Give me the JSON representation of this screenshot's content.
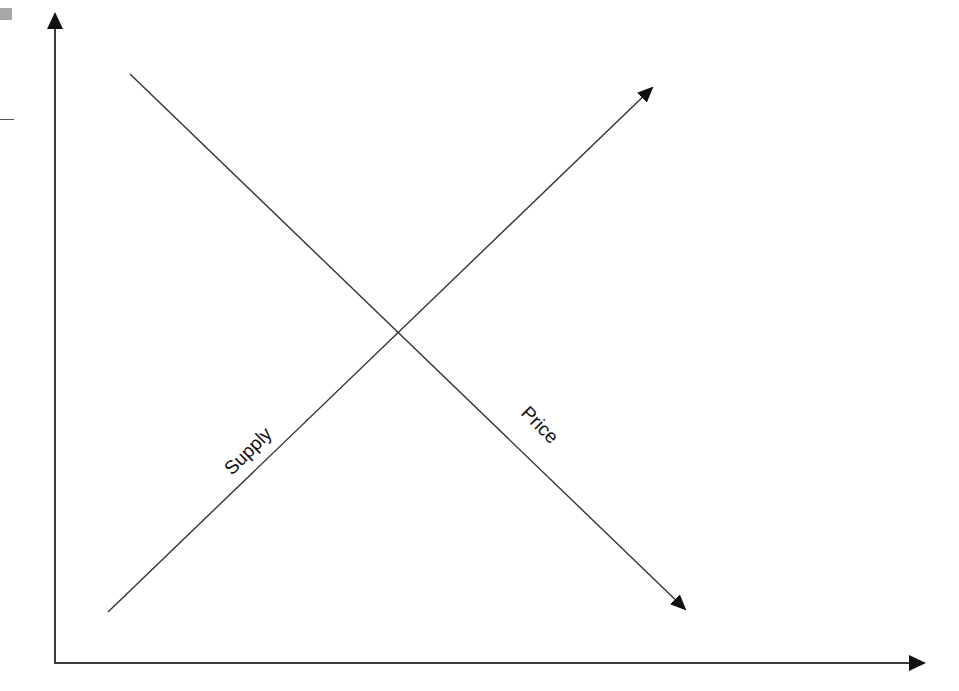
{
  "diagram": {
    "type": "supply-demand-style crossing lines",
    "labels": {
      "supply": "Supply",
      "price": "Price"
    },
    "colors": {
      "lines": "#333333",
      "axes": "#3a3a3a",
      "background": "#ffffff"
    },
    "axes": {
      "y_axis": {
        "x": 55,
        "y_top": 12,
        "y_bottom": 663,
        "arrow": "up"
      },
      "x_axis": {
        "y": 663,
        "x_left": 55,
        "x_right": 926,
        "arrow": "right"
      }
    },
    "lines": [
      {
        "name": "Supply",
        "from": [
          108,
          612
        ],
        "to": [
          654,
          86
        ],
        "arrow_end": "up-right"
      },
      {
        "name": "Price",
        "from": [
          130,
          74
        ],
        "to": [
          687,
          611
        ],
        "arrow_end": "down-right"
      }
    ],
    "intersection": [
      397,
      335
    ]
  }
}
